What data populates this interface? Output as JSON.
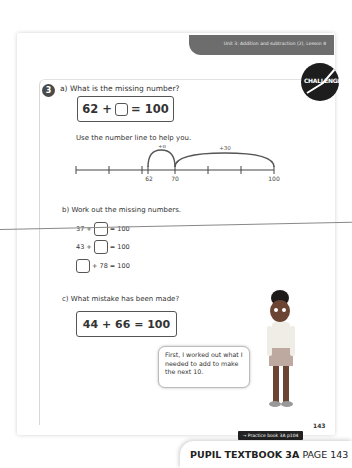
{
  "header": {
    "unit_label": "Unit 3: Addition and subtraction (2), Lesson 8"
  },
  "badge": {
    "label": "CHALLENGE"
  },
  "question": {
    "number": "3",
    "part_a": {
      "label": "a)  What is the missing number?",
      "equation": {
        "left": "62 +",
        "right": "= 100"
      },
      "hint": "Use the number line to help you.",
      "number_line": {
        "labels": [
          "62",
          "70",
          "100"
        ],
        "jumps": [
          "+8",
          "+30"
        ]
      }
    },
    "part_b": {
      "label": "b)  Work out the missing numbers.",
      "equations": [
        {
          "left": "37 +",
          "right": "= 100"
        },
        {
          "left": "43 +",
          "right": "= 100"
        },
        {
          "left": "",
          "right": "+ 78  = 100"
        }
      ]
    },
    "part_c": {
      "label": "c)  What mistake has been made?",
      "equation": "44 + 66 = 100"
    }
  },
  "speech_bubble": {
    "text": "First, I worked out what I needed to add to make the next 10."
  },
  "footer": {
    "page_number": "143",
    "practice_link": "→ Practice book 3A p104",
    "tag_bold": "PUPIL TEXTBOOK 3A",
    "tag_regular": "PAGE 143"
  }
}
